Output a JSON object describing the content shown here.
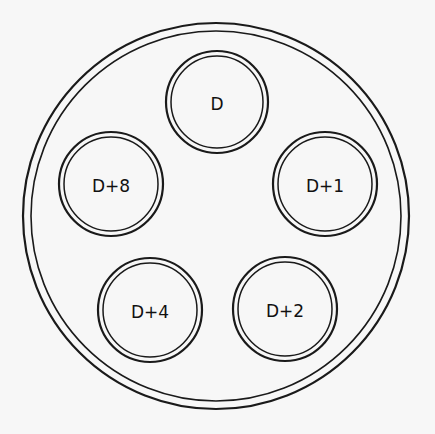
{
  "diagram": {
    "type": "petri-dish-well-layout",
    "stroke_color": "#1a1a1a",
    "background_color": "#f7f7f7",
    "dish": {
      "cx": 216,
      "cy": 216,
      "outer_radius": 193,
      "inner_radius": 185
    },
    "wells": [
      {
        "label": "D",
        "cx": 217,
        "cy": 102,
        "outer_radius": 51,
        "inner_radius": 46
      },
      {
        "label": "D+1",
        "cx": 325,
        "cy": 184,
        "outer_radius": 52,
        "inner_radius": 47
      },
      {
        "label": "D+2",
        "cx": 285,
        "cy": 309,
        "outer_radius": 52,
        "inner_radius": 47
      },
      {
        "label": "D+4",
        "cx": 150,
        "cy": 310,
        "outer_radius": 52,
        "inner_radius": 47
      },
      {
        "label": "D+8",
        "cx": 111,
        "cy": 184,
        "outer_radius": 52,
        "inner_radius": 47
      }
    ]
  }
}
